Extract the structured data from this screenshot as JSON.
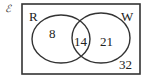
{
  "universal_symbol": "ℰ",
  "sets": [
    {
      "name": "R",
      "only_value": "8"
    },
    {
      "name": "W",
      "only_value": "21"
    }
  ],
  "intersection_value": "14",
  "outside_value": "32"
}
